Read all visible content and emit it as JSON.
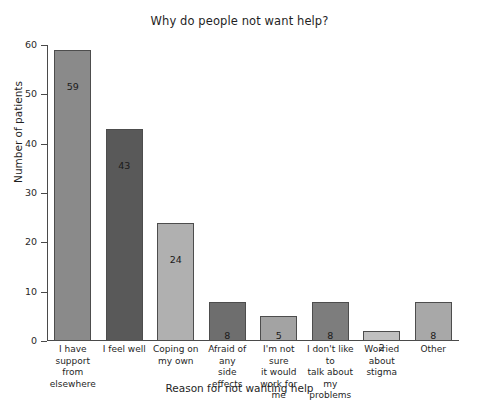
{
  "chart_data": {
    "type": "bar",
    "title": "Why do people not want help?",
    "xlabel": "Reason for not wanting help",
    "ylabel": "Number of patients",
    "ylim": [
      0,
      60
    ],
    "yticks": [
      0,
      10,
      20,
      30,
      40,
      50,
      60
    ],
    "grid": false,
    "legend": "none",
    "categories": [
      "I have\nsupport from\nelsewhere",
      "I feel well",
      "Coping on\nmy own",
      "Afraid of any\nside effects",
      "I'm not sure\nit would\nwork for me",
      "I don't like to\ntalk about\nmy problems",
      "Worried\nabout stigma",
      "Other"
    ],
    "values": [
      59,
      43,
      24,
      8,
      5,
      8,
      2,
      8
    ],
    "value_labels": [
      "59",
      "43",
      "24",
      "8",
      "5",
      "8",
      "2",
      "8"
    ],
    "bar_colors": [
      "#8a8a8a",
      "#595959",
      "#b0b0b0",
      "#6e6e6e",
      "#a3a3a3",
      "#7d7d7d",
      "#c0c0c0",
      "#a8a8a8"
    ],
    "bar_edge_color": "#4d4d4d",
    "axis_color": "#4a4a4a",
    "background": "#ffffff"
  },
  "ytick_labels": [
    "0",
    "10",
    "20",
    "30",
    "40",
    "50",
    "60"
  ]
}
